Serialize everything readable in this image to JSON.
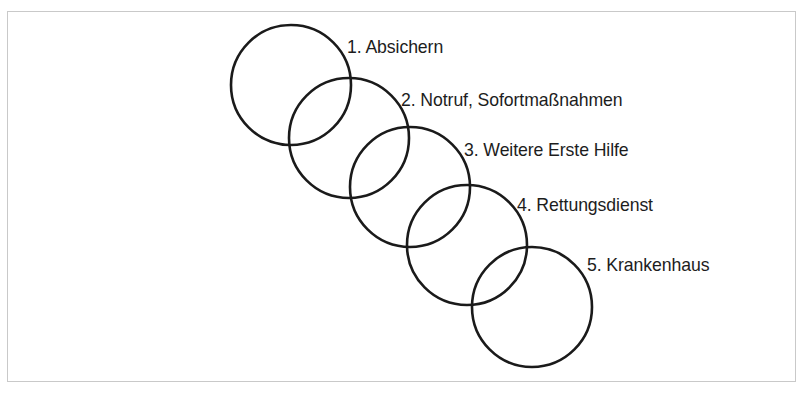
{
  "figure": {
    "background_color": "#ffffff",
    "frame": {
      "border_color": "#c9c9c9",
      "x": 7,
      "y": 11,
      "width": 789,
      "height": 371
    },
    "circle_style": {
      "stroke_color": "#1a1a1a",
      "stroke_width": 2.6,
      "fill": "none",
      "radius": 60
    },
    "steps": [
      {
        "number": "1.",
        "label": "1. Absichern",
        "text": "Absichern",
        "circle": {
          "cx": 291,
          "cy": 85,
          "r": 60
        },
        "label_x": 347,
        "label_y": 37
      },
      {
        "number": "2.",
        "label": "2. Notruf, Sofortmaßnahmen",
        "text": "Notruf, Sofortmaßnahmen",
        "circle": {
          "cx": 349,
          "cy": 138,
          "r": 60
        },
        "label_x": 401,
        "label_y": 90
      },
      {
        "number": "3.",
        "label": "3. Weitere Erste Hilfe",
        "text": "Weitere Erste Hilfe",
        "circle": {
          "cx": 410,
          "cy": 187,
          "r": 60
        },
        "label_x": 464,
        "label_y": 140
      },
      {
        "number": "4.",
        "label": "4. Rettungsdienst",
        "text": "Rettungsdienst",
        "circle": {
          "cx": 467,
          "cy": 245,
          "r": 60
        },
        "label_x": 517,
        "label_y": 195
      },
      {
        "number": "5.",
        "label": "5. Krankenhaus",
        "text": "Krankenhaus",
        "circle": {
          "cx": 532,
          "cy": 307,
          "r": 60
        },
        "label_x": 587,
        "label_y": 255
      }
    ]
  }
}
